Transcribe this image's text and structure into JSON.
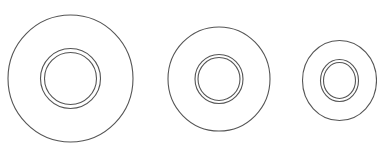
{
  "diagram": {
    "width": 377,
    "height": 151,
    "background": "#ffffff",
    "stroke_color": "#555555",
    "figures": [
      {
        "name": "washer-large",
        "cx": 70.5,
        "cy": 78.5,
        "outer": {
          "rx": 62.5,
          "ry": 63.5
        },
        "inner_outer": {
          "rx": 30,
          "ry": 30
        },
        "inner_inner": {
          "rx": 26,
          "ry": 26
        }
      },
      {
        "name": "washer-medium",
        "cx": 219,
        "cy": 79,
        "outer": {
          "rx": 51,
          "ry": 52
        },
        "inner_outer": {
          "rx": 24,
          "ry": 24.5
        },
        "inner_inner": {
          "rx": 21,
          "ry": 21.5
        }
      },
      {
        "name": "washer-small",
        "cx": 339.5,
        "cy": 80.5,
        "outer": {
          "rx": 37,
          "ry": 40
        },
        "inner_outer": {
          "rx": 19,
          "ry": 21
        },
        "inner_inner": {
          "rx": 16,
          "ry": 18
        }
      }
    ]
  }
}
